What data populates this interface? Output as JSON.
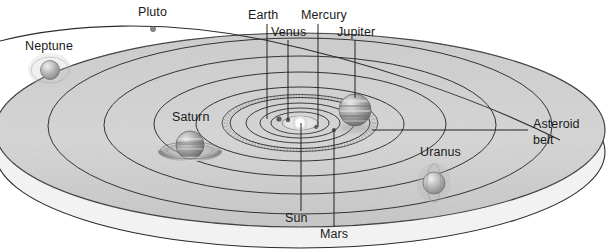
{
  "diagram": {
    "type": "astronomical-diagram",
    "view": "oblique-perspective",
    "palette": {
      "disc_fill": "#d3d3d3",
      "disc_fill_lower": "#eaeaea",
      "orbit_stroke": "#2b2b2b",
      "label_text": "#1a1a1a",
      "leader_line": "#1a1a1a",
      "background": "#ffffff",
      "sun_glow": "#ffffff",
      "planet_body": "#9a9a9a"
    },
    "labels": {
      "pluto": "Pluto",
      "neptune": "Neptune",
      "earth": "Earth",
      "venus": "Venus",
      "mercury": "Mercury",
      "jupiter": "Jupiter",
      "saturn": "Saturn",
      "uranus": "Uranus",
      "asteroid_belt_line1": "Asteroid",
      "asteroid_belt_line2": "belt",
      "sun": "Sun",
      "mars": "Mars"
    },
    "bodies": [
      {
        "name": "Sun",
        "cx": 300,
        "cy": 123,
        "r": 7.5,
        "kind": "star",
        "rings": false,
        "label_position": "below"
      },
      {
        "name": "Mercury",
        "cx": 316,
        "cy": 127,
        "r": 2.0,
        "kind": "planet",
        "rings": false,
        "label_position": "above"
      },
      {
        "name": "Venus",
        "cx": 288,
        "cy": 120,
        "r": 2.4,
        "kind": "planet",
        "rings": false,
        "label_position": "above"
      },
      {
        "name": "Earth",
        "cx": 279,
        "cy": 119,
        "r": 2.6,
        "kind": "planet",
        "rings": false,
        "label_position": "above"
      },
      {
        "name": "Mars",
        "cx": 334,
        "cy": 130,
        "r": 2.2,
        "kind": "planet",
        "rings": false,
        "label_position": "below"
      },
      {
        "name": "Jupiter",
        "cx": 355,
        "cy": 110,
        "r": 16.0,
        "kind": "gas-giant",
        "rings": false,
        "label_position": "above"
      },
      {
        "name": "Saturn",
        "cx": 190,
        "cy": 145,
        "r": 14.0,
        "kind": "gas-giant",
        "rings": true,
        "label_position": "above-left"
      },
      {
        "name": "Uranus",
        "cx": 434,
        "cy": 183,
        "r": 11.0,
        "kind": "ice-giant",
        "rings": true,
        "label_position": "above"
      },
      {
        "name": "Neptune",
        "cx": 50,
        "cy": 70,
        "r": 9.5,
        "kind": "ice-giant",
        "rings": true,
        "label_position": "above"
      },
      {
        "name": "Pluto",
        "cx": 153,
        "cy": 29,
        "r": 2.0,
        "kind": "dwarf-planet",
        "rings": false,
        "label_position": "above"
      }
    ],
    "orbits": [
      {
        "body": "Mercury",
        "rx": 18,
        "ry": 7
      },
      {
        "body": "Venus",
        "rx": 29,
        "ry": 11
      },
      {
        "body": "Earth",
        "rx": 40,
        "ry": 15
      },
      {
        "body": "Mars",
        "rx": 54,
        "ry": 20
      },
      {
        "body": "Asteroid belt",
        "rx": 72,
        "ry": 26
      },
      {
        "body": "Jupiter",
        "rx": 104,
        "ry": 37
      },
      {
        "body": "Saturn",
        "rx": 146,
        "ry": 52
      },
      {
        "body": "Uranus",
        "rx": 196,
        "ry": 69
      },
      {
        "body": "Neptune",
        "rx": 252,
        "ry": 88
      },
      {
        "body": "Pluto",
        "rx": 300,
        "ry": 104,
        "inclined": true
      }
    ],
    "annotations": [
      {
        "target": "Earth",
        "label": "Earth",
        "leader": "vertical",
        "from_x": 267,
        "from_y": 24,
        "to_x": 267,
        "to_y": 119
      },
      {
        "target": "Venus",
        "label": "Venus",
        "leader": "vertical",
        "from_x": 288,
        "from_y": 38,
        "to_x": 288,
        "to_y": 120
      },
      {
        "target": "Mercury",
        "label": "Mercury",
        "leader": "vertical",
        "from_x": 318,
        "from_y": 24,
        "to_x": 318,
        "to_y": 127
      },
      {
        "target": "Jupiter",
        "label": "Jupiter",
        "leader": "vertical",
        "from_x": 355,
        "from_y": 38,
        "to_x": 355,
        "to_y": 100
      },
      {
        "target": "Sun",
        "label": "Sun",
        "leader": "vertical",
        "from_x": 301,
        "from_y": 123,
        "to_x": 301,
        "to_y": 212
      },
      {
        "target": "Mars",
        "label": "Mars",
        "leader": "vertical",
        "from_x": 334,
        "from_y": 130,
        "to_x": 334,
        "to_y": 228
      },
      {
        "target": "Asteroid belt",
        "label": "Asteroid belt",
        "leader": "horizontal",
        "from_x": 370,
        "from_y": 130,
        "to_x": 530,
        "to_y": 130
      },
      {
        "target": "Pluto",
        "label": "Pluto",
        "leader": "none"
      },
      {
        "target": "Neptune",
        "label": "Neptune",
        "leader": "none"
      },
      {
        "target": "Saturn",
        "label": "Saturn",
        "leader": "none"
      },
      {
        "target": "Uranus",
        "label": "Uranus",
        "leader": "none"
      }
    ]
  }
}
